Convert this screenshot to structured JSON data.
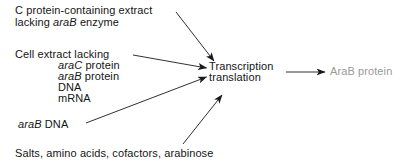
{
  "diagram": {
    "title_visible": false,
    "type": "reaction-flow-diagram",
    "background_color": "#ffffff",
    "text_color": "#151515",
    "muted_text_color": "#9a9a9a",
    "inputs": {
      "extract": {
        "line1": "C protein-containing extract",
        "line2_prefix": "lacking ",
        "line2_italic": "araB",
        "line2_suffix": " enzyme"
      },
      "cell_extract": {
        "heading": "Cell extract lacking",
        "items": [
          {
            "italic": "araC",
            "rest": " protein"
          },
          {
            "italic": "araB",
            "rest": " protein"
          },
          {
            "italic": "",
            "rest": "DNA"
          },
          {
            "italic": "",
            "rest": "mRNA"
          }
        ]
      },
      "arab_dna": {
        "italic": "araB",
        "rest": " DNA"
      },
      "salts": "Salts, amino acids, cofactors, arabinose"
    },
    "process": {
      "line1": "Transcription",
      "line2": "translation"
    },
    "output": {
      "label": "AraB protein"
    },
    "arrows": [
      {
        "name": "extract-to-process",
        "from": [
          176,
          12
        ],
        "to": [
          214,
          61
        ]
      },
      {
        "name": "cell-extract-to-process",
        "from": [
          133,
          55
        ],
        "to": [
          206,
          68
        ]
      },
      {
        "name": "arab-dna-to-process",
        "from": [
          86,
          123
        ],
        "to": [
          206,
          77
        ]
      },
      {
        "name": "salts-to-process",
        "from": [
          183,
          144
        ],
        "to": [
          222,
          95
        ]
      },
      {
        "name": "process-to-output",
        "from": [
          286,
          72
        ],
        "to": [
          325,
          72
        ]
      }
    ]
  }
}
